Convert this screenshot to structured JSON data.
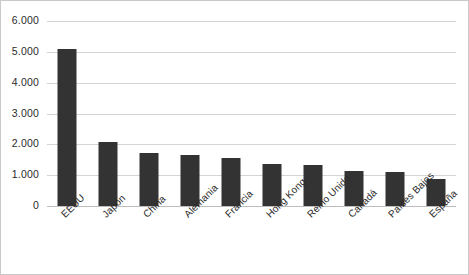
{
  "chart_data": {
    "type": "bar",
    "title": "",
    "subtitle": "",
    "xlabel": "",
    "ylabel": "",
    "categories": [
      "EEUU",
      "Japón",
      "China",
      "Alemania",
      "Francia",
      "Hong Kong",
      "Reino Unido",
      "Canadá",
      "Países Bajos",
      "España"
    ],
    "values": [
      5100,
      2080,
      1720,
      1650,
      1560,
      1360,
      1330,
      1140,
      1100,
      870
    ],
    "ylim": [
      0,
      6000
    ],
    "ytick_values": [
      0,
      1000,
      2000,
      3000,
      4000,
      5000,
      6000
    ],
    "ytick_labels": [
      "0",
      "1.000",
      "2.000",
      "3.000",
      "4.000",
      "5.000",
      "6.000"
    ],
    "grid": true,
    "legend": false,
    "legend_position": "none",
    "bar_color": "#333333",
    "gridline_color": "#d4d4d4",
    "plot_border_color": "#c9c9c9",
    "background_color": "#ffffff"
  }
}
